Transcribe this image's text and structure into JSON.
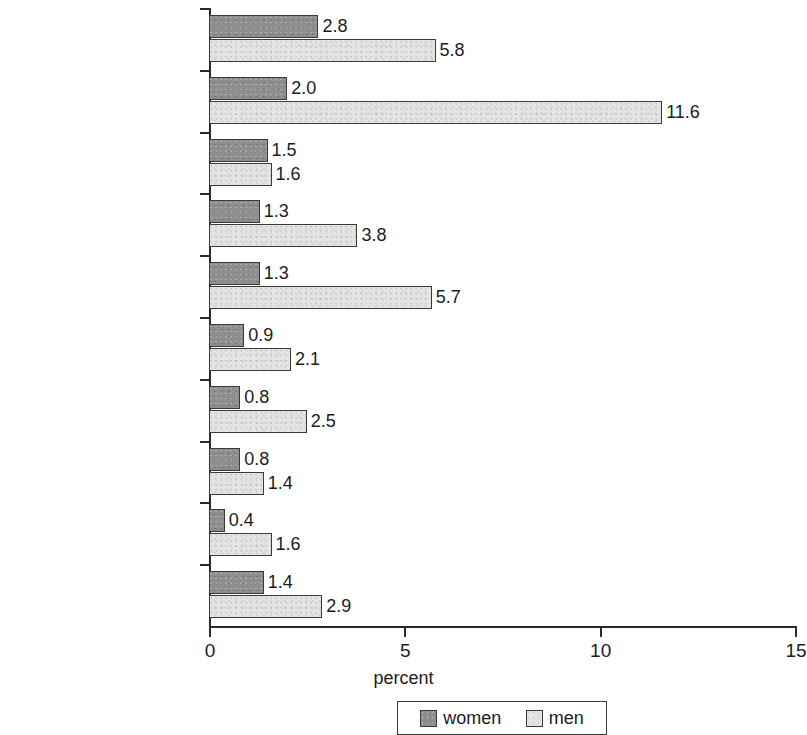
{
  "chart_data": {
    "type": "bar",
    "orientation": "horizontal",
    "title": "",
    "xlabel": "percent",
    "ylabel": "",
    "xlim": [
      0,
      15
    ],
    "xticks": [
      "0",
      "5",
      "10",
      "15"
    ],
    "xtick_values": [
      0,
      5,
      10,
      15
    ],
    "grid": false,
    "legend_position": "bottom",
    "categories": [
      "Latin America and the\nCaribbean",
      "Northern Africa",
      "Eastern Asia",
      "Southeastern Asia",
      "Western Asia",
      "Southern Asia",
      "Sub-Saharan Africa",
      "Commonwealth of\nIndependent States",
      "Oceania",
      "Developing Regions"
    ],
    "series": [
      {
        "name": "women",
        "color": "#8e8e8e",
        "values": [
          2.8,
          2.0,
          1.5,
          1.3,
          1.3,
          0.9,
          0.8,
          0.8,
          0.4,
          1.4
        ],
        "labels": [
          "2.8",
          "2.0",
          "1.5",
          "1.3",
          "1.3",
          "0.9",
          "0.8",
          "0.8",
          "0.4",
          "1.4"
        ]
      },
      {
        "name": "men",
        "color": "#e3e3e3",
        "values": [
          5.8,
          11.6,
          1.6,
          3.8,
          5.7,
          2.1,
          2.5,
          1.4,
          1.6,
          2.9
        ],
        "labels": [
          "5.8",
          "11.6",
          "1.6",
          "3.8",
          "5.7",
          "2.1",
          "2.5",
          "1.4",
          "1.6",
          "2.9"
        ]
      }
    ]
  },
  "legend": {
    "entries": [
      {
        "label": "women",
        "swatch": "women"
      },
      {
        "label": "men",
        "swatch": "men"
      }
    ]
  },
  "axis": {
    "x_title": "percent"
  }
}
